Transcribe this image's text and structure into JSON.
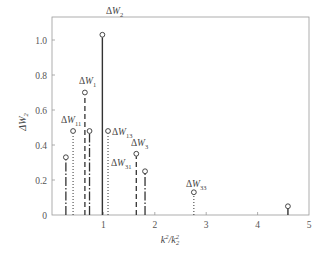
{
  "chart_data": {
    "type": "stem",
    "title": "",
    "xlabel": "k²/k₂²",
    "ylabel": "ΔW₂",
    "xlim": [
      0,
      5
    ],
    "ylim": [
      0,
      1.1
    ],
    "xticks": [
      "1",
      "2",
      "3",
      "4",
      "5"
    ],
    "yticks": [
      "0",
      "0.2",
      "0.4",
      "0.6",
      "0.8",
      "1.0"
    ],
    "grid": false,
    "legend": "none",
    "stems": [
      {
        "x": 0.27,
        "y": 0.33,
        "style": "dash-dot",
        "label": ""
      },
      {
        "x": 0.41,
        "y": 0.48,
        "style": "dotted",
        "label": "ΔW11"
      },
      {
        "x": 0.64,
        "y": 0.7,
        "style": "dashed",
        "label": "ΔW1"
      },
      {
        "x": 0.73,
        "y": 0.48,
        "style": "dash-dot",
        "label": ""
      },
      {
        "x": 0.98,
        "y": 1.03,
        "style": "solid",
        "label": "ΔW2"
      },
      {
        "x": 1.09,
        "y": 0.48,
        "style": "dotted",
        "label": "ΔW13"
      },
      {
        "x": 1.64,
        "y": 0.35,
        "style": "dashed",
        "label": "ΔW3"
      },
      {
        "x": 1.81,
        "y": 0.25,
        "style": "dash-dot",
        "label": ""
      },
      {
        "x": 2.76,
        "y": 0.13,
        "style": "dotted",
        "label": "ΔW33"
      },
      {
        "x": 4.59,
        "y": 0.05,
        "style": "solid",
        "label": ""
      }
    ],
    "annotations": [
      {
        "text": "ΔW2",
        "base": "ΔW",
        "sub": "2"
      },
      {
        "text": "ΔW1",
        "base": "ΔW",
        "sub": "1"
      },
      {
        "text": "ΔW11",
        "base": "ΔW",
        "sub": "11"
      },
      {
        "text": "ΔW13",
        "base": "ΔW",
        "sub": "13"
      },
      {
        "text": "ΔW3",
        "base": "ΔW",
        "sub": "3"
      },
      {
        "text": "ΔW31",
        "base": "ΔW",
        "sub": "31"
      },
      {
        "text": "ΔW33",
        "base": "ΔW",
        "sub": "33"
      }
    ]
  },
  "labels": {
    "ylabel_base": "ΔW",
    "ylabel_sub": "2",
    "xlabel_k": "k",
    "xlabel_sup": "2",
    "xlabel_slash": "/k",
    "xlabel_sub": "2",
    "xlabel_sup2": "2",
    "origin": "0"
  }
}
